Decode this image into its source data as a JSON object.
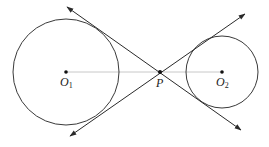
{
  "diagram": {
    "colors": {
      "stroke": "#3a3a3a",
      "center_line": "#c8c8c8",
      "background": "#ffffff"
    },
    "circles": [
      {
        "id": "O1",
        "label": "O",
        "subscript": "1",
        "cx": 66,
        "cy": 72,
        "r": 53
      },
      {
        "id": "O2",
        "label": "O",
        "subscript": "2",
        "cx": 222,
        "cy": 72,
        "r": 36
      }
    ],
    "point_p": {
      "label": "P",
      "x": 160,
      "y": 72
    },
    "tangent_lines": [
      {
        "id": "tangent-1",
        "from": [
          241,
          130
        ],
        "to": [
          67,
          7
        ]
      },
      {
        "id": "tangent-2",
        "from": [
          70,
          136
        ],
        "to": [
          245,
          14
        ]
      }
    ],
    "center_line": {
      "from": [
        66,
        72
      ],
      "to": [
        222,
        72
      ]
    }
  }
}
